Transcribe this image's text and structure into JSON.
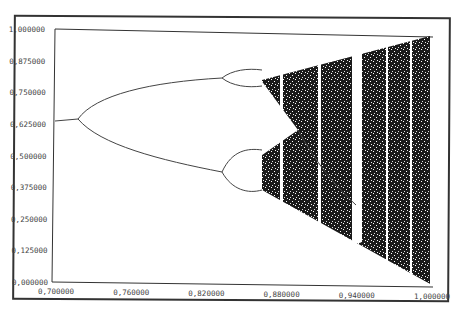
{
  "chart_data": {
    "type": "scatter",
    "title": "",
    "subtitle": "",
    "xlabel": "",
    "ylabel": "",
    "xlim": [
      0.7,
      1.0
    ],
    "ylim": [
      0.0,
      1.0
    ],
    "grid": false,
    "legend": null,
    "x_ticks": [
      "0,700000",
      "0,760000",
      "0,820000",
      "0,880000",
      "0,940000",
      "1,000000"
    ],
    "y_ticks": [
      "0,000000",
      "0,125000",
      "0,250000",
      "0,375000",
      "0,500000",
      "0,625000",
      "0,750000",
      "0,875000",
      "1,000000"
    ],
    "key_points": {
      "fixed_point": {
        "x": [
          0.7,
          0.72
        ],
        "y": [
          0.635,
          0.645
        ]
      },
      "period2_split": {
        "x": 0.72,
        "y": 0.645
      },
      "period2_upper_at_0_833": 0.82,
      "period2_lower_at_0_833": 0.43,
      "period4_split_x": 0.833,
      "chaos_onset_x": 0.862,
      "chaos_band_at_1_0": [
        0.0,
        1.0
      ],
      "window_x": [
        0.874,
        0.885,
        0.906,
        0.957
      ]
    }
  }
}
